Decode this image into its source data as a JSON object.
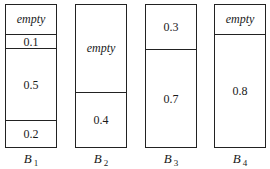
{
  "bins": [
    {
      "name": "B",
      "sub": "1",
      "segments": [
        {
          "label": "empty",
          "value": null,
          "top": 0,
          "height": 29
        },
        {
          "label": "0.1",
          "value": 0.1,
          "top": 29,
          "height": 14
        },
        {
          "label": "0.5",
          "value": 0.5,
          "top": 43,
          "height": 72
        },
        {
          "label": "0.2",
          "value": 0.2,
          "top": 115,
          "height": 29
        }
      ]
    },
    {
      "name": "B",
      "sub": "2",
      "segments": [
        {
          "label": "empty",
          "value": null,
          "top": 0,
          "height": 87
        },
        {
          "label": "0.4",
          "value": 0.4,
          "top": 87,
          "height": 57
        }
      ]
    },
    {
      "name": "B",
      "sub": "3",
      "segments": [
        {
          "label": "0.3",
          "value": 0.3,
          "top": 0,
          "height": 44
        },
        {
          "label": "0.7",
          "value": 0.7,
          "top": 44,
          "height": 100
        }
      ]
    },
    {
      "name": "B",
      "sub": "4",
      "segments": [
        {
          "label": "empty",
          "value": null,
          "top": 0,
          "height": 29
        },
        {
          "label": "0.8",
          "value": 0.8,
          "top": 29,
          "height": 115
        }
      ]
    }
  ]
}
